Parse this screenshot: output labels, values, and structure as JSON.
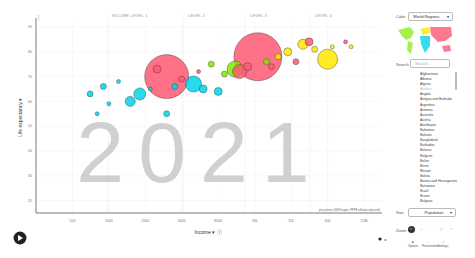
{
  "chart_data": {
    "type": "scatter",
    "title": "2021",
    "xlabel": "Income",
    "ylabel": "Life expectancy",
    "x_scale": "log",
    "x_ticks": [
      "500",
      "1000",
      "2000",
      "4000",
      "8000",
      "16k",
      "32k",
      "64k",
      "128k"
    ],
    "y_ticks": [
      20,
      30,
      40,
      50,
      60,
      70,
      80,
      90
    ],
    "ylim": [
      15,
      92
    ],
    "x_unit_note": "per person (GDP/capita, PPP$ inflation-adjusted)",
    "y_unit_note": "years",
    "year_watermark": "2021",
    "size_by": "Population",
    "color_by": "World Regions",
    "bubbles": [
      {
        "x": 3000,
        "y": 70,
        "r": 22,
        "color": "#ff5872",
        "label": "India"
      },
      {
        "x": 17000,
        "y": 78,
        "r": 24,
        "color": "#ff5872",
        "label": "China"
      },
      {
        "x": 64000,
        "y": 77,
        "r": 10,
        "color": "#ffe700",
        "label": "United States"
      },
      {
        "x": 11000,
        "y": 73,
        "r": 8,
        "color": "#7feb00",
        "label": "Brazil"
      },
      {
        "x": 12000,
        "y": 72,
        "r": 7,
        "color": "#ff5872",
        "label": "Indonesia"
      },
      {
        "x": 5000,
        "y": 67,
        "r": 8,
        "color": "#00d5e9",
        "label": "Nigeria"
      },
      {
        "x": 1800,
        "y": 63,
        "r": 6,
        "color": "#00d5e9",
        "label": "Ethiopia"
      },
      {
        "x": 1500,
        "y": 60,
        "r": 5,
        "color": "#00d5e9",
        "label": ""
      },
      {
        "x": 700,
        "y": 63,
        "r": 3,
        "color": "#00d5e9",
        "label": ""
      },
      {
        "x": 900,
        "y": 66,
        "r": 3,
        "color": "#00d5e9",
        "label": ""
      },
      {
        "x": 2500,
        "y": 73,
        "r": 4,
        "color": "#ff5872",
        "label": ""
      },
      {
        "x": 6000,
        "y": 65,
        "r": 4,
        "color": "#00d5e9",
        "label": ""
      },
      {
        "x": 8000,
        "y": 64,
        "r": 4,
        "color": "#00d5e9",
        "label": ""
      },
      {
        "x": 40000,
        "y": 83,
        "r": 5,
        "color": "#ffe700",
        "label": ""
      },
      {
        "x": 45000,
        "y": 84,
        "r": 4,
        "color": "#ff5872",
        "label": ""
      },
      {
        "x": 30000,
        "y": 80,
        "r": 4,
        "color": "#ffe700",
        "label": ""
      },
      {
        "x": 25000,
        "y": 78,
        "r": 3,
        "color": "#ffe700",
        "label": ""
      },
      {
        "x": 20000,
        "y": 76,
        "r": 3,
        "color": "#7feb00",
        "label": ""
      },
      {
        "x": 50000,
        "y": 81,
        "r": 3,
        "color": "#ffe700",
        "label": ""
      },
      {
        "x": 14000,
        "y": 74,
        "r": 4,
        "color": "#ff5872",
        "label": ""
      },
      {
        "x": 9000,
        "y": 71,
        "r": 3,
        "color": "#7feb00",
        "label": ""
      },
      {
        "x": 4000,
        "y": 69,
        "r": 3,
        "color": "#ff5872",
        "label": ""
      },
      {
        "x": 3500,
        "y": 66,
        "r": 3,
        "color": "#00d5e9",
        "label": ""
      },
      {
        "x": 2200,
        "y": 65,
        "r": 2,
        "color": "#00d5e9",
        "label": ""
      },
      {
        "x": 1200,
        "y": 68,
        "r": 2,
        "color": "#00d5e9",
        "label": ""
      },
      {
        "x": 70000,
        "y": 82,
        "r": 2,
        "color": "#ffe700",
        "label": ""
      },
      {
        "x": 90000,
        "y": 84,
        "r": 2,
        "color": "#ff5872",
        "label": ""
      },
      {
        "x": 100000,
        "y": 82,
        "r": 2,
        "color": "#ffe700",
        "label": ""
      },
      {
        "x": 35000,
        "y": 76,
        "r": 3,
        "color": "#ff5872",
        "label": ""
      },
      {
        "x": 22000,
        "y": 74,
        "r": 3,
        "color": "#ff5872",
        "label": ""
      },
      {
        "x": 5500,
        "y": 72,
        "r": 2,
        "color": "#ff5872",
        "label": ""
      },
      {
        "x": 7000,
        "y": 75,
        "r": 3,
        "color": "#7feb00",
        "label": ""
      },
      {
        "x": 1000,
        "y": 59,
        "r": 2,
        "color": "#00d5e9",
        "label": ""
      },
      {
        "x": 800,
        "y": 55,
        "r": 2,
        "color": "#00d5e9",
        "label": ""
      },
      {
        "x": 3000,
        "y": 55,
        "r": 3,
        "color": "#00d5e9",
        "label": ""
      }
    ]
  },
  "chart_header": {
    "level_labels": [
      "INCOME LEVEL 1",
      "LEVEL 2",
      "LEVEL 3",
      "LEVEL 4"
    ]
  },
  "axes": {
    "y_title": "Life expectancy",
    "y_unit": "years",
    "x_title": "Income",
    "x_note": "per person (GDP/capita, PPP$ inflation-adjusted)"
  },
  "sidebar": {
    "color_label": "Color",
    "color_value": "World Regions",
    "search_label": "Search",
    "search_placeholder": "Search...",
    "countries": [
      "Afghanistan",
      "Albania",
      "Algeria",
      "Andorra",
      "Angola",
      "Antigua and Barbuda",
      "Argentina",
      "Armenia",
      "Australia",
      "Austria",
      "Azerbaijan",
      "Bahamas",
      "Bahrain",
      "Bangladesh",
      "Barbados",
      "Belarus",
      "Belgium",
      "Belize",
      "Benin",
      "Bhutan",
      "Bolivia",
      "Bosnia and Herzegovina",
      "Botswana",
      "Brazil",
      "Brunei",
      "Bulgaria"
    ],
    "size_label": "Size",
    "size_value": "Population",
    "zoom_label": "Zoom",
    "zoom_buttons": [
      "arrow",
      "+",
      "-",
      "[]",
      "undo"
    ],
    "tools": [
      "Options",
      "Presentation",
      "Settings"
    ]
  },
  "colors": {
    "africa": "#00d5e9",
    "asia": "#ff5872",
    "europe": "#ffe700",
    "americas": "#7feb00",
    "year_watermark": "#c8c8c8"
  }
}
